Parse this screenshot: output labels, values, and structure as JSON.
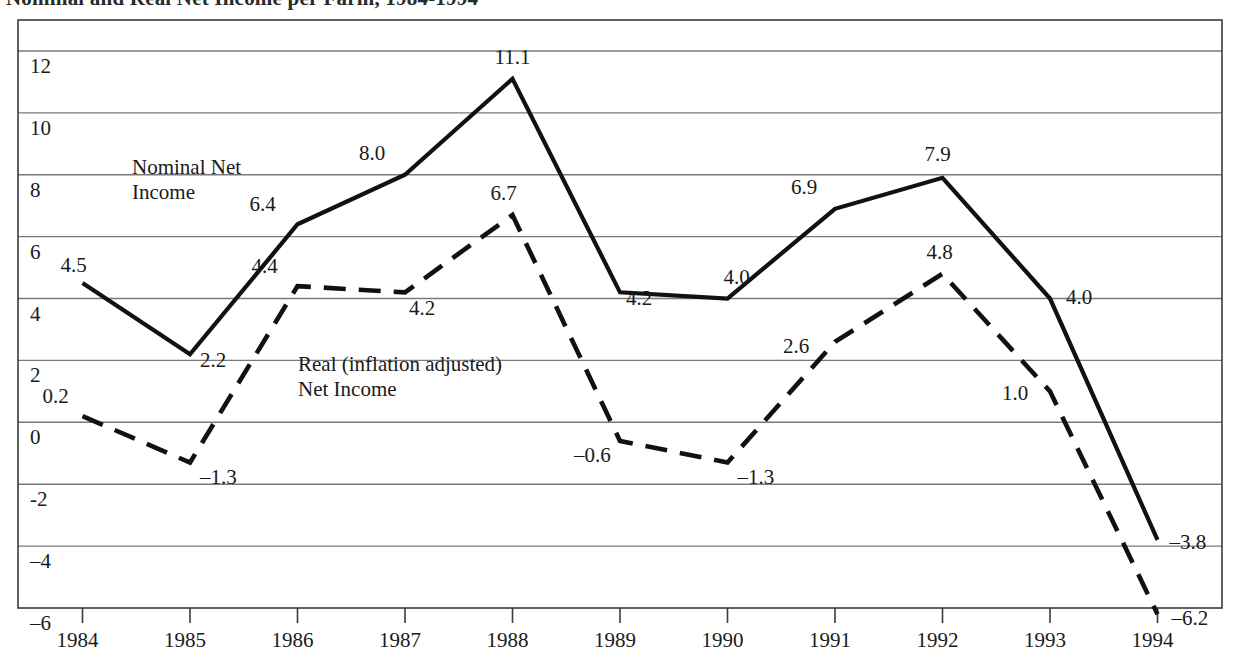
{
  "figure": {
    "title_clipped": "Nominal and Real Net Income per Farm, 1984-1994",
    "frame": {
      "x0": 18,
      "y0": 20,
      "x1": 1222,
      "y1": 608
    }
  },
  "axes": {
    "y_ticks": [
      "12",
      "10",
      "8",
      "6",
      "4",
      "2",
      "0",
      "-2",
      "–4",
      "–6"
    ],
    "y_values": [
      12,
      10,
      8,
      6,
      4,
      2,
      0,
      -2,
      -4,
      -6
    ],
    "x_ticks": [
      "1984",
      "1985",
      "1986",
      "1987",
      "1988",
      "1989",
      "1990",
      "1991",
      "1992",
      "1993",
      "1994"
    ]
  },
  "series_labels": {
    "nominal_line1": "Nominal Net",
    "nominal_line2": "Income",
    "real_line1": "Real (inflation adjusted)",
    "real_line2": "Net Income"
  },
  "nominal_labels": [
    "4.5",
    "2.2",
    "6.4",
    "8.0",
    "11.1",
    "4.2",
    "4.0",
    "6.9",
    "7.9",
    "4.0",
    "–3.8"
  ],
  "real_labels": [
    "0.2",
    "–1.3",
    "4.4",
    "4.2",
    "6.7",
    "–0.6",
    "–1.3",
    "2.6",
    "4.8",
    "1.0",
    "–6.2"
  ],
  "colors": {
    "line": "#111111",
    "grid": "#7a7a7a",
    "frame": "#3a3a3a",
    "text": "#1a1a1a",
    "background": "#ffffff"
  },
  "chart_data": {
    "type": "line",
    "title": "Nominal and Real Net Income per Farm, 1984-1994",
    "xlabel": "",
    "ylabel": "",
    "x": [
      1984,
      1985,
      1986,
      1987,
      1988,
      1989,
      1990,
      1991,
      1992,
      1993,
      1994
    ],
    "categories": [
      "1984",
      "1985",
      "1986",
      "1987",
      "1988",
      "1989",
      "1990",
      "1991",
      "1992",
      "1993",
      "1994"
    ],
    "series": [
      {
        "name": "Nominal Net Income",
        "style": "solid",
        "values": [
          4.5,
          2.2,
          6.4,
          8.0,
          11.1,
          4.2,
          4.0,
          6.9,
          7.9,
          4.0,
          -3.8
        ],
        "labels": [
          "4.5",
          "2.2",
          "6.4",
          "8.0",
          "11.1",
          "4.2",
          "4.0",
          "6.9",
          "7.9",
          "4.0",
          "–3.8"
        ]
      },
      {
        "name": "Real (inflation adjusted) Net Income",
        "style": "dashed",
        "values": [
          0.2,
          -1.3,
          4.4,
          4.2,
          6.7,
          -0.6,
          -1.3,
          2.6,
          4.8,
          1.0,
          -6.2
        ],
        "labels": [
          "0.2",
          "–1.3",
          "4.4",
          "4.2",
          "6.7",
          "–0.6",
          "–1.3",
          "2.6",
          "4.8",
          "1.0",
          "–6.2"
        ]
      }
    ],
    "ylim": [
      -6,
      13
    ],
    "xlim": [
      1983.4,
      1994.6
    ],
    "yticks": [
      12,
      10,
      8,
      6,
      4,
      2,
      0,
      -2,
      -4,
      -6
    ],
    "grid": true,
    "grid_axis": "y",
    "legend": "inline-annotations"
  }
}
